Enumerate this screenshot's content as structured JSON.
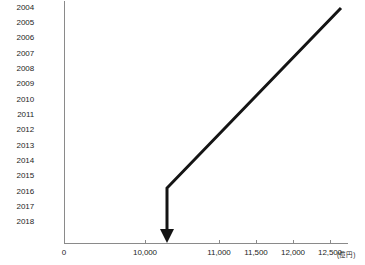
{
  "chart_data": {
    "type": "bar",
    "orientation": "horizontal",
    "title": "",
    "xlabel": "",
    "ylabel": "",
    "unit_label": "(億円)",
    "categories": [
      "2004",
      "2005",
      "2006",
      "2007",
      "2008",
      "2009",
      "2010",
      "2011",
      "2012",
      "2013",
      "2014",
      "2015",
      "2016",
      "2017",
      "2018"
    ],
    "values": [
      12415,
      12317,
      12214,
      12043,
      11813,
      11695,
      11585,
      11528,
      11366,
      10792,
      11123,
      10945,
      10945,
      10971,
      10971
    ],
    "value_labels": [
      "12,415",
      "12,317",
      "12,214",
      "12,043",
      "11,813",
      "11,695",
      "11,585",
      "11,528",
      "11,366",
      "10,792",
      "11,123",
      "10,945",
      "10,945",
      "10,971",
      "10,971"
    ],
    "highlight_category": "2018",
    "xlim": [
      0,
      12500
    ],
    "axis_break": true,
    "axis_break_note": "scale broken between 0 and 10,000",
    "xticks": [
      0,
      10000,
      11000,
      11500,
      12000,
      12500
    ],
    "xtick_labels": [
      "0",
      "10,000",
      "11,000",
      "11,500",
      "12,000",
      "12,500"
    ],
    "grid": false,
    "legend": "none",
    "series": [
      {
        "name": "金額",
        "values": [
          12415,
          12317,
          12214,
          12043,
          11813,
          11695,
          11585,
          11528,
          11366,
          10792,
          11123,
          10945,
          10945,
          10971,
          10971
        ]
      }
    ],
    "annotations": [
      {
        "name": "decline-arrow",
        "type": "bent-arrow",
        "from": [
          341,
          8
        ],
        "bend": [
          167,
          188
        ],
        "to": [
          167,
          243
        ],
        "color": "#141414"
      }
    ],
    "colors": {
      "bar": "#6b6b6b",
      "bar_highlight": "#141414",
      "value_text": "#ffffff",
      "axis": "#8a8a8a",
      "tick_text": "#1d1d1d",
      "background": "#ffffff"
    }
  }
}
